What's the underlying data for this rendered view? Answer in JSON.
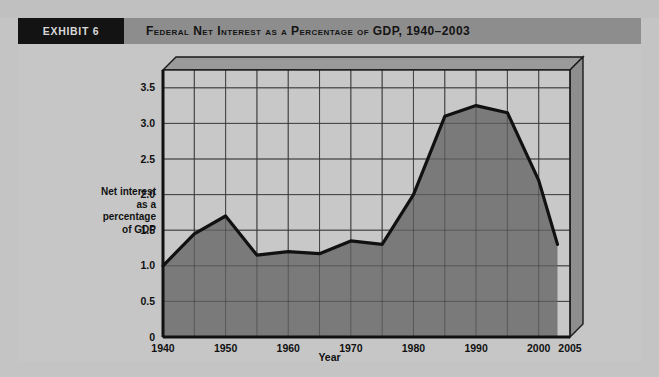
{
  "exhibit": {
    "tag": "EXHIBIT 6",
    "title": "Federal Net Interest as a Percentage of GDP, 1940–2003"
  },
  "colors": {
    "page_background": "#c4c4c4",
    "header_bar": "#8d8d8d",
    "exhibit_tag_background": "#131313",
    "exhibit_tag_text": "#d8d8d8",
    "plot_background": "#c8c8c8",
    "area_fill": "#7a7a7a",
    "line": "#111111",
    "gridline": "#3a3a3a",
    "depth_top": "#9a9a9a",
    "depth_right": "#8e8e8e"
  },
  "chart_data": {
    "type": "area",
    "title": "Federal Net Interest as a Percentage of GDP, 1940–2003",
    "xlabel": "Year",
    "ylabel": "Net interest as a percentage of GDP",
    "ylabel_lines": [
      "Net interest",
      "as a",
      "percentage",
      "of GDP"
    ],
    "xlim": [
      1940,
      2005
    ],
    "ylim": [
      0,
      3.75
    ],
    "grid": true,
    "legend": "none",
    "x_tick_labels": [
      "1940",
      "1950",
      "1960",
      "1970",
      "1980",
      "1990",
      "2000",
      "2005"
    ],
    "x_tick_values": [
      1940,
      1950,
      1960,
      1970,
      1980,
      1990,
      2000,
      2005
    ],
    "x_minor_values": [
      1945,
      1955,
      1965,
      1975,
      1985,
      1995
    ],
    "y_tick_labels": [
      "0",
      "0.5",
      "1.0",
      "1.5",
      "2.0",
      "2.5",
      "3.0",
      "3.5"
    ],
    "y_tick_values": [
      0,
      0.5,
      1.0,
      1.5,
      2.0,
      2.5,
      3.0,
      3.5
    ],
    "series_name": "Net interest as a percentage of GDP",
    "x": [
      1940,
      1945,
      1950,
      1955,
      1960,
      1965,
      1970,
      1975,
      1980,
      1985,
      1990,
      1995,
      2000,
      2003
    ],
    "values": [
      1.0,
      1.45,
      1.7,
      1.15,
      1.2,
      1.17,
      1.35,
      1.3,
      2.0,
      3.1,
      3.25,
      3.15,
      2.2,
      1.3
    ]
  },
  "bottom_note": ""
}
